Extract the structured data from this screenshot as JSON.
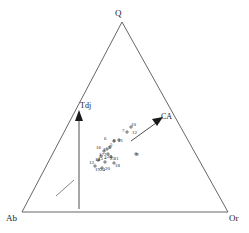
{
  "chart_data": {
    "type": "scatter",
    "title": "",
    "subtitle": "",
    "plot_shape": "ternary",
    "xlabel": "",
    "ylabel": "",
    "grid": false,
    "legend_position": "none",
    "axes": [
      {
        "name": "Q",
        "label": "Q",
        "position": "top-apex"
      },
      {
        "name": "Ab",
        "label": "Ab",
        "position": "bottom-left-apex"
      },
      {
        "name": "Or",
        "label": "Or",
        "position": "bottom-right-apex"
      }
    ],
    "annotations": [
      {
        "label": "Tdj",
        "type": "trend-arrow",
        "direction": "up"
      },
      {
        "label": "CA",
        "type": "trend-arrow",
        "direction": "up-right"
      }
    ],
    "series": [
      {
        "name": "samples",
        "marker": "cross",
        "points": [
          {
            "label": "6",
            "x": 0.42,
            "y": 0.415
          },
          {
            "label": "7",
            "x": 0.492,
            "y": 0.498
          },
          {
            "label": "10",
            "x": 0.523,
            "y": 0.53
          },
          {
            "label": "12",
            "x": 0.53,
            "y": 0.486
          },
          {
            "label": "8",
            "x": 0.456,
            "y": 0.42
          },
          {
            "label": "21",
            "x": 0.47,
            "y": 0.418
          },
          {
            "label": "5",
            "x": 0.436,
            "y": 0.396
          },
          {
            "label": "3",
            "x": 0.428,
            "y": 0.388
          },
          {
            "label": "16",
            "x": 0.396,
            "y": 0.378
          },
          {
            "label": "1",
            "x": 0.414,
            "y": 0.372
          },
          {
            "label": "2",
            "x": 0.42,
            "y": 0.352
          },
          {
            "label": "17",
            "x": 0.408,
            "y": 0.348
          },
          {
            "label": "4",
            "x": 0.418,
            "y": 0.344
          },
          {
            "label": "22",
            "x": 0.428,
            "y": 0.34
          },
          {
            "label": "23",
            "x": 0.436,
            "y": 0.336
          },
          {
            "label": "11",
            "x": 0.452,
            "y": 0.33
          },
          {
            "label": "14",
            "x": 0.394,
            "y": 0.33
          },
          {
            "label": "15",
            "x": 0.404,
            "y": 0.326
          },
          {
            "label": "13",
            "x": 0.38,
            "y": 0.312
          },
          {
            "label": "18",
            "x": 0.458,
            "y": 0.306
          },
          {
            "label": "20",
            "x": 0.426,
            "y": 0.298
          },
          {
            "label": "19",
            "x": 0.398,
            "y": 0.292
          },
          {
            "label": "24",
            "x": 0.41,
            "y": 0.29
          },
          {
            "label": "9",
            "x": 0.536,
            "y": 0.352
          }
        ]
      }
    ]
  },
  "vertices": {
    "top": "Q",
    "bottom_left": "Ab",
    "bottom_right": "Or"
  },
  "trends": {
    "tdj": "Tdj",
    "ca": "CA"
  },
  "point_labels": [
    {
      "text": "10",
      "left": 131,
      "top": 122
    },
    {
      "text": "7",
      "left": 122,
      "top": 128
    },
    {
      "text": "12",
      "left": 132,
      "top": 130
    },
    {
      "text": "8",
      "left": 113,
      "top": 138
    },
    {
      "text": "21",
      "left": 118,
      "top": 138
    },
    {
      "text": "6",
      "left": 104,
      "top": 136
    },
    {
      "text": "5",
      "left": 110,
      "top": 142
    },
    {
      "text": "3",
      "left": 108,
      "top": 145
    },
    {
      "text": "16",
      "left": 96,
      "top": 145
    },
    {
      "text": "1",
      "left": 103,
      "top": 147
    },
    {
      "text": "2",
      "left": 104,
      "top": 152
    },
    {
      "text": "17",
      "left": 99,
      "top": 152
    },
    {
      "text": "4",
      "left": 104,
      "top": 155
    },
    {
      "text": "22",
      "left": 107,
      "top": 154
    },
    {
      "text": "23",
      "left": 110,
      "top": 156
    },
    {
      "text": "11",
      "left": 114,
      "top": 156
    },
    {
      "text": "14",
      "left": 95,
      "top": 157
    },
    {
      "text": "15",
      "left": 98,
      "top": 156
    },
    {
      "text": "13",
      "left": 89,
      "top": 160
    },
    {
      "text": "18",
      "left": 115,
      "top": 163
    },
    {
      "text": "20",
      "left": 105,
      "top": 166
    },
    {
      "text": "19",
      "left": 95,
      "top": 167
    },
    {
      "text": "24",
      "left": 100,
      "top": 167
    },
    {
      "text": "9",
      "left": 136,
      "top": 152
    }
  ],
  "colors": {
    "line": "#555555",
    "text": "#1a1a1a",
    "marker": "#2b2b2b",
    "background": "#ffffff"
  }
}
